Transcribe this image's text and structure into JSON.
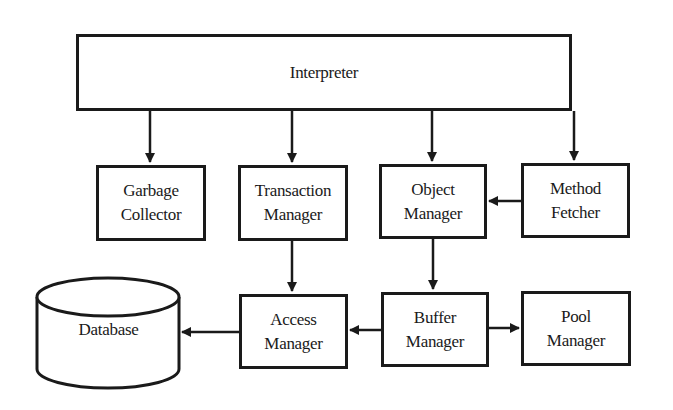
{
  "diagram": {
    "colors": {
      "stroke": "#1a1a1a",
      "background": "#ffffff"
    },
    "nodes": {
      "interpreter": {
        "lines": [
          "Interpreter"
        ]
      },
      "garbage_collector": {
        "lines": [
          "Garbage",
          "Collector"
        ]
      },
      "transaction_manager": {
        "lines": [
          "Transaction",
          "Manager"
        ]
      },
      "object_manager": {
        "lines": [
          "Object",
          "Manager"
        ]
      },
      "method_fetcher": {
        "lines": [
          "Method",
          "Fetcher"
        ]
      },
      "access_manager": {
        "lines": [
          "Access",
          "Manager"
        ]
      },
      "buffer_manager": {
        "lines": [
          "Buffer",
          "Manager"
        ]
      },
      "pool_manager": {
        "lines": [
          "Pool",
          "Manager"
        ]
      },
      "database": {
        "lines": [
          "Database"
        ],
        "shape": "cylinder"
      }
    },
    "edges": [
      {
        "from": "Interpreter",
        "to": "Garbage Collector"
      },
      {
        "from": "Interpreter",
        "to": "Transaction Manager"
      },
      {
        "from": "Interpreter",
        "to": "Object Manager"
      },
      {
        "from": "Interpreter",
        "to": "Method Fetcher"
      },
      {
        "from": "Method Fetcher",
        "to": "Object Manager"
      },
      {
        "from": "Transaction Manager",
        "to": "Access Manager"
      },
      {
        "from": "Object Manager",
        "to": "Buffer Manager"
      },
      {
        "from": "Access Manager",
        "to": "Database"
      },
      {
        "from": "Buffer Manager",
        "to": "Access Manager"
      },
      {
        "from": "Buffer Manager",
        "to": "Pool Manager"
      }
    ]
  }
}
